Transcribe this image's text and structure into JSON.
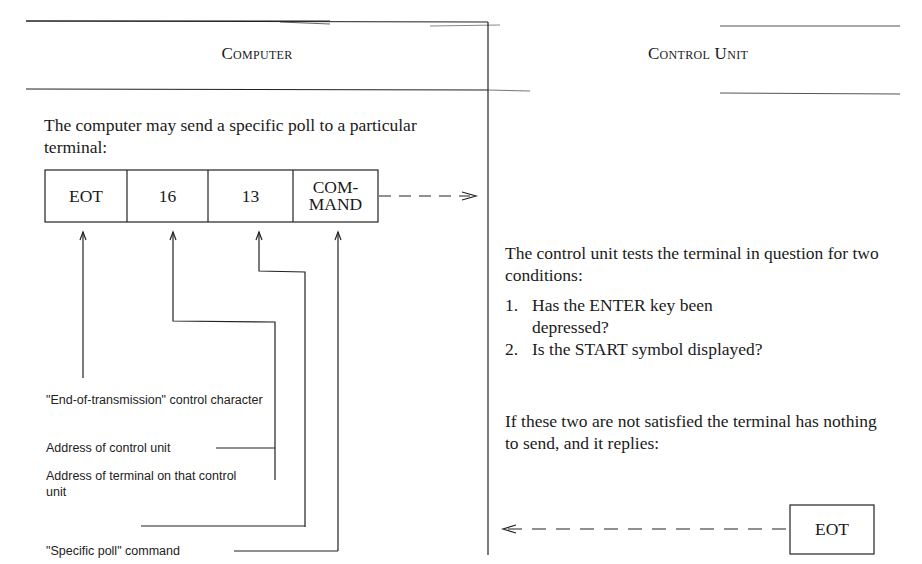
{
  "headers": {
    "left": "Computer",
    "right": "Control Unit"
  },
  "left": {
    "intro": "The computer may send a specific poll to a particular terminal:",
    "message_fields": [
      {
        "label": "EOT"
      },
      {
        "label": "16"
      },
      {
        "label": "13"
      },
      {
        "label": "COM-\nMAND"
      }
    ],
    "annotations": [
      {
        "text": "\"End-of-transmission\" control character"
      },
      {
        "text": "Address of control unit"
      },
      {
        "text": "Address of terminal on that control unit"
      },
      {
        "text": "\"Specific poll\" command"
      }
    ]
  },
  "right": {
    "intro": "The control unit tests the terminal in question for two conditions:",
    "conditions": [
      {
        "number": "1.",
        "text": "Has the ENTER key been depressed?"
      },
      {
        "number": "2.",
        "text": "Is the START symbol displayed?"
      }
    ],
    "outcome": "If these two are not satisfied the terminal has nothing to send, and it replies:",
    "reply_field": "EOT"
  }
}
